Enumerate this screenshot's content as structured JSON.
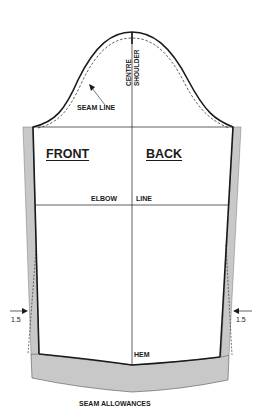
{
  "diagram": {
    "type": "sleeve-pattern",
    "labels": {
      "centre": "CENTRE",
      "shoulder": "SHOULDER",
      "seam_line": "SEAM LINE",
      "front": "FRONT",
      "back": "BACK",
      "elbow": "ELBOW",
      "line": "LINE",
      "left_allowance": "1.5",
      "right_allowance": "1.5",
      "hem": "HEM",
      "caption": "SEAM ALLOWANCES"
    },
    "colors": {
      "outline": "#1a1a1a",
      "allowance_fill": "#c8c8c8",
      "background": "#ffffff"
    }
  }
}
